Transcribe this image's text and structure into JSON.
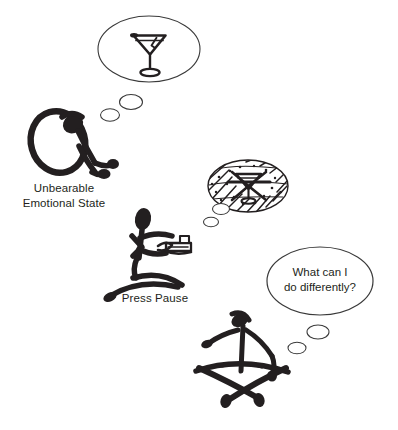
{
  "figure": {
    "type": "hand-drawn-illustration",
    "background_color": "#ffffff",
    "ink_color": "#231f20",
    "panels": [
      {
        "id": "panel-1",
        "caption": "Unbearable\nEmotional State",
        "figure_pose": "slumped-hunched-person",
        "thought_bubble": {
          "contents_icon": "martini-glass-icon",
          "contents_description": "cocktail glass",
          "crossed_out": false,
          "trail_bubbles": 2
        }
      },
      {
        "id": "panel-2",
        "caption": "Press Pause",
        "figure_pose": "kneeling-person-holding-remote",
        "prop_icon": "remote-control-icon",
        "thought_bubble": {
          "contents_icon": "martini-glass-crossed-out-icon",
          "contents_description": "cocktail glass scribbled over",
          "crossed_out": true,
          "trail_bubbles": 2
        }
      },
      {
        "id": "panel-3",
        "caption": "",
        "figure_pose": "seated-cross-legged-meditating-person",
        "thought_bubble": {
          "contents_text": "What can I\ndo differently?",
          "crossed_out": false,
          "trail_bubbles": 2
        }
      }
    ]
  },
  "labels": {
    "unbearable_emotional_state": "Unbearable\nEmotional State",
    "press_pause": "Press Pause",
    "what_can_i_do_differently": "What can I\ndo differently?"
  }
}
